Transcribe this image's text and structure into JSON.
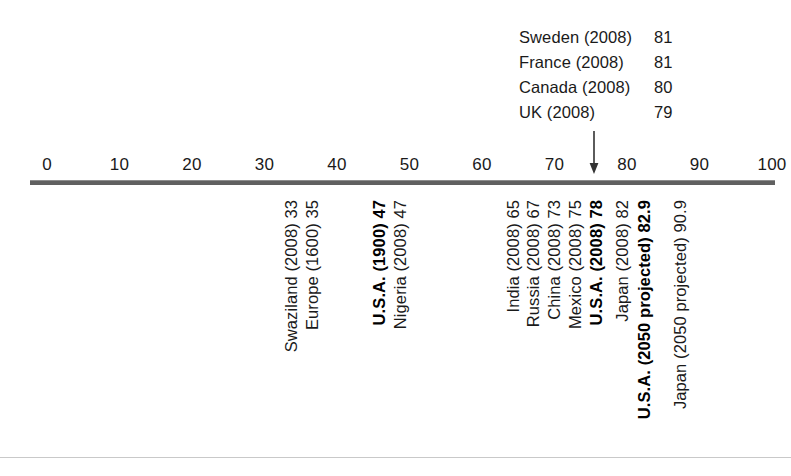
{
  "chart_data": {
    "type": "scatter",
    "title": "",
    "subtitle": "",
    "xlabel": "",
    "ylabel": "",
    "xlim": [
      0,
      100
    ],
    "grid": false,
    "legend": "none",
    "orientation": "horizontal-number-line",
    "tick_labels": [
      "0",
      "10",
      "20",
      "30",
      "40",
      "50",
      "60",
      "70",
      "80",
      "90",
      "100"
    ],
    "tick_values": [
      0,
      10,
      20,
      30,
      40,
      50,
      60,
      70,
      80,
      90,
      100
    ],
    "pointer": {
      "name": "arrow-marker",
      "target_value": 78,
      "glyph": "down-arrow"
    },
    "callout": {
      "rows": [
        {
          "label": "Sweden (2008)",
          "value": "81"
        },
        {
          "label": "France (2008)",
          "value": "81"
        },
        {
          "label": "Canada (2008)",
          "value": "80"
        },
        {
          "label": "UK (2008)",
          "value": "79"
        }
      ]
    },
    "categories": [
      "Swaziland (2008)",
      "Europe (1600)",
      "U.S.A. (1900)",
      "Nigeria (2008)",
      "India (2008)",
      "Russia (2008)",
      "China (2008)",
      "Mexico (2008)",
      "U.S.A. (2008)",
      "Japan (2008)",
      "U.S.A. (2050 projected)",
      "Japan (2050 projected)"
    ],
    "values": [
      33,
      35,
      47,
      47,
      65,
      67,
      73,
      75,
      78,
      82,
      82.9,
      90.9
    ],
    "points": [
      {
        "text": "Swaziland (2008) 33",
        "value": 33,
        "bold": false,
        "x": 283
      },
      {
        "text": "Europe (1600) 35",
        "value": 35,
        "bold": false,
        "x": 304
      },
      {
        "text": "U.S.A. (1900) 47",
        "value": 47,
        "bold": true,
        "x": 371
      },
      {
        "text": "Nigeria (2008) 47",
        "value": 47,
        "bold": false,
        "x": 392
      },
      {
        "text": "India (2008) 65",
        "value": 65,
        "bold": false,
        "x": 505
      },
      {
        "text": "Russia (2008) 67",
        "value": 67,
        "bold": false,
        "x": 525
      },
      {
        "text": "China (2008) 73",
        "value": 73,
        "bold": false,
        "x": 546
      },
      {
        "text": "Mexico (2008) 75",
        "value": 75,
        "bold": false,
        "x": 567
      },
      {
        "text": "U.S.A. (2008) 78",
        "value": 78,
        "bold": true,
        "x": 588
      },
      {
        "text": "Japan (2008) 82",
        "value": 82,
        "bold": false,
        "x": 614
      },
      {
        "text": "U.S.A. (2050 projected) 82.9",
        "value": 82.9,
        "bold": true,
        "x": 636
      },
      {
        "text": "Japan (2050 projected) 90.9",
        "value": 90.9,
        "bold": false,
        "x": 672
      }
    ]
  },
  "colors": {
    "axis": "#606060",
    "text": "#1a1a1a",
    "bold_text": "#000000",
    "rule": "#c9c9c9",
    "background": "#ffffff"
  }
}
